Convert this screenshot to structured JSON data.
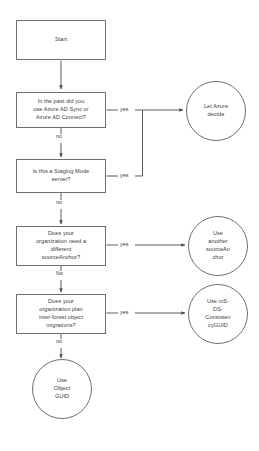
{
  "diagram": {
    "type": "flowchart",
    "stroke_color": "#6e6e6e",
    "text_color": "#3b3b3b",
    "background_color": "#ffffff",
    "nodes": [
      {
        "id": "start",
        "shape": "rectangle",
        "label": "Start"
      },
      {
        "id": "past-sync",
        "shape": "rectangle",
        "label": "In the past did you\nuse Azure AD Sync or\nAzure AD Connect?"
      },
      {
        "id": "staging-mode",
        "shape": "rectangle",
        "label": "Is this a Staging Mode\nserver?"
      },
      {
        "id": "different-anchor",
        "shape": "rectangle",
        "label": "Does your\norganization need a\ndifferent\nsourceAnchor?"
      },
      {
        "id": "inter-forest",
        "shape": "rectangle",
        "label": "Does your\norganization plan\ninter-forest object\nmigrations?"
      },
      {
        "id": "let-azure-decide",
        "shape": "circle",
        "label": "Let Azure\ndecide"
      },
      {
        "id": "another-anchor",
        "shape": "circle",
        "label": "Use\nanother\nsourceAn\nchor"
      },
      {
        "id": "ms-ds-consistency-guid",
        "shape": "circle",
        "label": "Use mS-\nDS-\nConsisten\ncyGUID"
      },
      {
        "id": "object-guid",
        "shape": "circle",
        "label": "Use\nObject\nGUID"
      }
    ],
    "edges": [
      {
        "id": "start-to-past-sync",
        "from": "start",
        "to": "past-sync",
        "label": ""
      },
      {
        "id": "past-sync-yes",
        "from": "past-sync",
        "to": "let-azure-decide",
        "label": "yes"
      },
      {
        "id": "past-sync-no",
        "from": "past-sync",
        "to": "staging-mode",
        "label": "no"
      },
      {
        "id": "staging-mode-yes",
        "from": "staging-mode",
        "to": "let-azure-decide",
        "label": "yes"
      },
      {
        "id": "staging-mode-no",
        "from": "staging-mode",
        "to": "different-anchor",
        "label": "no"
      },
      {
        "id": "different-anchor-yes",
        "from": "different-anchor",
        "to": "another-anchor",
        "label": "yes"
      },
      {
        "id": "different-anchor-no",
        "from": "different-anchor",
        "to": "inter-forest",
        "label": "No"
      },
      {
        "id": "inter-forest-yes",
        "from": "inter-forest",
        "to": "ms-ds-consistency-guid",
        "label": "yes"
      },
      {
        "id": "inter-forest-no",
        "from": "inter-forest",
        "to": "object-guid",
        "label": "no"
      }
    ]
  }
}
